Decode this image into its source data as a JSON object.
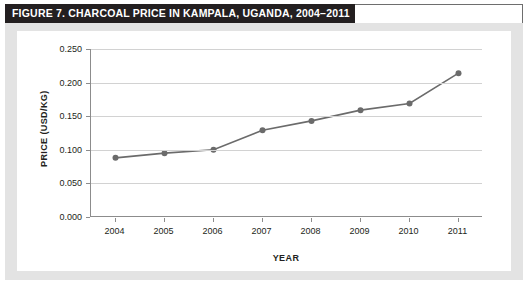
{
  "figure": {
    "title": "FIGURE 7.  CHARCOAL PRICE IN KAMPALA, UGANDA, 2004–2011",
    "title_bg": "#231f20",
    "title_color": "#ffffff",
    "panel_bg": "#e3e3e3",
    "plot_bg": "#ffffff"
  },
  "chart_data": {
    "type": "line",
    "title": "FIGURE 7.  CHARCOAL PRICE IN KAMPALA, UGANDA, 2004–2011",
    "xlabel": "YEAR",
    "ylabel": "PRICE (USD/KG)",
    "categories": [
      "2004",
      "2005",
      "2006",
      "2007",
      "2008",
      "2009",
      "2010",
      "2011"
    ],
    "x": [
      2004,
      2005,
      2006,
      2007,
      2008,
      2009,
      2010,
      2011
    ],
    "values": [
      0.088,
      0.095,
      0.1,
      0.129,
      0.143,
      0.159,
      0.169,
      0.214
    ],
    "series": [
      {
        "name": "Charcoal price",
        "values": [
          0.088,
          0.095,
          0.1,
          0.129,
          0.143,
          0.159,
          0.169,
          0.214
        ],
        "color": "#6b6b6b",
        "marker": "circle"
      }
    ],
    "ylim": [
      0.0,
      0.25
    ],
    "yticks": [
      0.0,
      0.05,
      0.1,
      0.15,
      0.2,
      0.25
    ],
    "ytick_labels": [
      "0.000",
      "0.050",
      "0.100",
      "0.150",
      "0.200",
      "0.250"
    ],
    "xtick_labels": [
      "2004",
      "2005",
      "2006",
      "2007",
      "2008",
      "2009",
      "2010",
      "2011"
    ],
    "grid": "horizontal",
    "legend": "none",
    "line_color": "#6b6b6b",
    "marker_color": "#6b6b6b",
    "axis_color": "#8c8c8c",
    "gridline_color": "#d2d2d2"
  }
}
